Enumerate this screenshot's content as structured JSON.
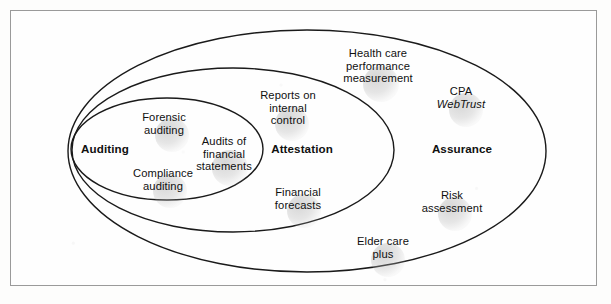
{
  "figure": {
    "type": "nested-set-venn",
    "background_color": "#fdfdfc",
    "frame_color": "#9a9a9a",
    "stroke_color": "#1a1a1a"
  },
  "sets": [
    {
      "id": "assurance",
      "name": "Assurance",
      "level": 3,
      "label_x": 462,
      "label_y": 148,
      "ellipse": {
        "cx": 307,
        "cy": 151,
        "rx": 239,
        "ry": 121
      }
    },
    {
      "id": "attestation",
      "name": "Attestation",
      "level": 2,
      "label_x": 302,
      "label_y": 148,
      "ellipse": {
        "cx": 233,
        "cy": 150,
        "rx": 161,
        "ry": 82
      }
    },
    {
      "id": "auditing",
      "name": "Auditing",
      "level": 1,
      "label_x": 105,
      "label_y": 148,
      "ellipse": {
        "cx": 167,
        "cy": 149,
        "rx": 96,
        "ry": 51
      }
    }
  ],
  "services": [
    {
      "id": "forensic-auditing",
      "text": "Forensic\nauditing",
      "set": "auditing",
      "x": 164,
      "y": 124,
      "blob_x": 172,
      "blob_y": 135,
      "blob_r": 17
    },
    {
      "id": "audits-of-financial-statements",
      "text": "Audits of\nfinancial\nstatements",
      "set": "auditing",
      "x": 224,
      "y": 154,
      "blob_x": 230,
      "blob_y": 168,
      "blob_r": 18
    },
    {
      "id": "compliance-auditing",
      "text": "Compliance\nauditing",
      "set": "auditing",
      "x": 163,
      "y": 180,
      "blob_x": 170,
      "blob_y": 191,
      "blob_r": 17
    },
    {
      "id": "reports-on-internal-control",
      "text": "Reports on\ninternal\ncontrol",
      "set": "attestation",
      "x": 288,
      "y": 108,
      "blob_x": 292,
      "blob_y": 124,
      "blob_r": 17
    },
    {
      "id": "financial-forecasts",
      "text": "Financial\nforecasts",
      "set": "attestation",
      "x": 298,
      "y": 199,
      "blob_x": 304,
      "blob_y": 211,
      "blob_r": 17
    },
    {
      "id": "health-care-performance-measurement",
      "text": "Health care\nperformance\nmeasurement",
      "set": "assurance",
      "x": 378,
      "y": 66,
      "blob_x": 381,
      "blob_y": 84,
      "blob_r": 18
    },
    {
      "id": "cpa-webtrust",
      "text": "CPA",
      "text2": "WebTrust",
      "italic_second_line": true,
      "set": "assurance",
      "x": 461,
      "y": 98,
      "blob_x": 466,
      "blob_y": 110,
      "blob_r": 17
    },
    {
      "id": "risk-assessment",
      "text": "Risk\nassessment",
      "set": "assurance",
      "x": 452,
      "y": 202,
      "blob_x": 455,
      "blob_y": 214,
      "blob_r": 17
    },
    {
      "id": "elder-care-plus",
      "text": "Elder care\nplus",
      "set": "assurance",
      "x": 383,
      "y": 248,
      "blob_x": 388,
      "blob_y": 260,
      "blob_r": 17
    }
  ]
}
